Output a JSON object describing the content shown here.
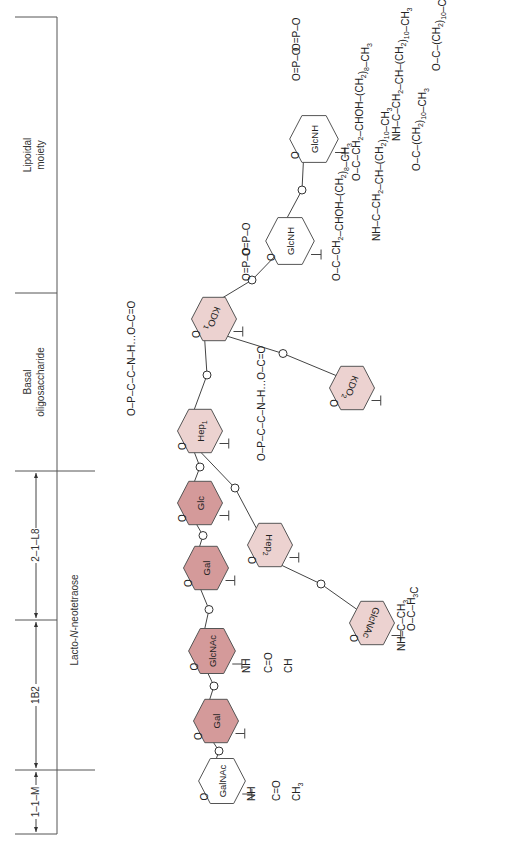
{
  "regions": {
    "lipoidal": "Lipoidal\nmoiety",
    "lipoidal_line1": "Lipoidal",
    "lipoidal_line2": "moiety",
    "basal_line1": "Basal",
    "basal_line2": "oligosaccharide",
    "lacto": "Lacto-N-neotetraose",
    "lacto_prefix": "Lacto-",
    "lacto_italic": "N",
    "lacto_suffix": "-neotetraose",
    "span_1_1_M": "1–1–M",
    "span_1B2": "1B2",
    "span_2_1_L8": "2–1–L8"
  },
  "colors": {
    "dark_sugar": "#d49a9a",
    "light_sugar": "#ecd2d0",
    "plain_sugar": "#ffffff",
    "stroke": "#444444"
  },
  "sugars": [
    {
      "id": "galnac",
      "label": "GalNAc",
      "shade": "plain"
    },
    {
      "id": "gal1",
      "label": "Gal",
      "shade": "dark"
    },
    {
      "id": "glcnac1",
      "label": "GlcNAc",
      "shade": "dark"
    },
    {
      "id": "gal2",
      "label": "Gal",
      "shade": "dark"
    },
    {
      "id": "glc",
      "label": "Glc",
      "shade": "dark"
    },
    {
      "id": "hep1",
      "label": "Hep",
      "sub": "1",
      "shade": "light"
    },
    {
      "id": "hep2",
      "label": "Hep",
      "sub": "2",
      "shade": "light"
    },
    {
      "id": "glcnac2",
      "label": "GlcNAc",
      "shade": "light"
    },
    {
      "id": "kdo1",
      "label": "KDO",
      "sub": "1",
      "shade": "light"
    },
    {
      "id": "kdo2",
      "label": "KDO",
      "sub": "2",
      "shade": "light"
    },
    {
      "id": "glcnh1",
      "label": "GlcNH",
      "shade": "plain"
    },
    {
      "id": "glcnh2",
      "label": "GlcNH",
      "shade": "plain"
    }
  ],
  "atoms": {
    "O": "O",
    "H": "H",
    "C": "C",
    "N": "N",
    "P": "P",
    "NH": "NH",
    "CH": "CH",
    "CH2": "CH",
    "CH3": "CH",
    "H3C": "H",
    "CHOH": "CHOH",
    "sub2": "2",
    "sub3": "3",
    "sub8": "8",
    "sub10": "10",
    "paren_open": "(",
    "paren_close": ")"
  }
}
